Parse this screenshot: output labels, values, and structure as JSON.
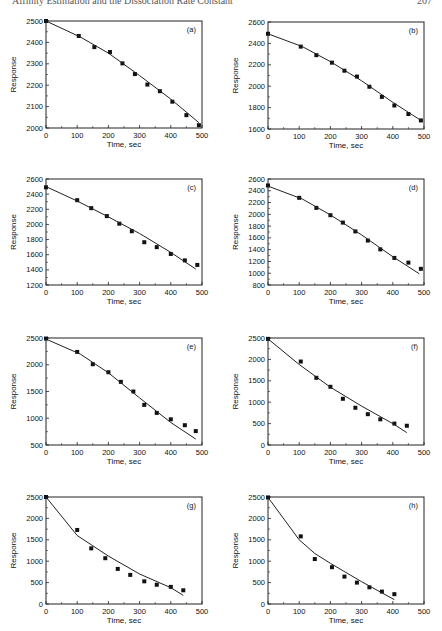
{
  "header": {
    "running_title": "Affinity Estimation and the Dissociation Rate Constant",
    "page_number": "207"
  },
  "chart_data": [
    {
      "id": "a",
      "type": "scatter",
      "panel_label": "(a)",
      "xlabel": "Time, sec",
      "ylabel": "Response",
      "xlim": [
        0,
        500
      ],
      "ylim": [
        2000,
        2500
      ],
      "xticks": [
        0,
        100,
        200,
        300,
        400,
        500
      ],
      "yticks": [
        2000,
        2100,
        2200,
        2300,
        2400,
        2500
      ],
      "series": [
        {
          "name": "data",
          "kind": "points",
          "x": [
            0,
            105,
            155,
            205,
            245,
            285,
            325,
            365,
            405,
            450,
            490
          ],
          "y": [
            2500,
            2430,
            2378,
            2355,
            2302,
            2252,
            2203,
            2172,
            2123,
            2060,
            2013
          ]
        },
        {
          "name": "fit",
          "kind": "line",
          "x": [
            0,
            110,
            200,
            300,
            400,
            490
          ],
          "y": [
            2500,
            2425,
            2350,
            2245,
            2135,
            2025
          ]
        }
      ]
    },
    {
      "id": "b",
      "type": "scatter",
      "panel_label": "(b)",
      "xlabel": "Time, sec",
      "ylabel": "Response",
      "xlim": [
        0,
        500
      ],
      "ylim": [
        1600,
        2600
      ],
      "xticks": [
        0,
        100,
        200,
        300,
        400,
        500
      ],
      "yticks": [
        1600,
        1800,
        2000,
        2200,
        2400,
        2600
      ],
      "series": [
        {
          "name": "data",
          "kind": "points",
          "x": [
            0,
            105,
            155,
            205,
            245,
            285,
            325,
            365,
            405,
            450,
            490
          ],
          "y": [
            2490,
            2370,
            2290,
            2220,
            2145,
            2090,
            1995,
            1900,
            1820,
            1740,
            1680
          ]
        },
        {
          "name": "fit",
          "kind": "line",
          "x": [
            0,
            110,
            200,
            300,
            400,
            490
          ],
          "y": [
            2490,
            2370,
            2230,
            2050,
            1850,
            1680
          ]
        }
      ]
    },
    {
      "id": "c",
      "type": "scatter",
      "panel_label": "(c)",
      "xlabel": "Time, sec",
      "ylabel": "Response",
      "xlim": [
        0,
        500
      ],
      "ylim": [
        1200,
        2600
      ],
      "xticks": [
        0,
        100,
        200,
        300,
        400,
        500
      ],
      "yticks": [
        1200,
        1400,
        1600,
        1800,
        2000,
        2200,
        2400,
        2600
      ],
      "series": [
        {
          "name": "data",
          "kind": "points",
          "x": [
            0,
            100,
            145,
            195,
            235,
            275,
            315,
            355,
            400,
            445,
            485
          ],
          "y": [
            2490,
            2320,
            2215,
            2110,
            2010,
            1910,
            1765,
            1700,
            1610,
            1525,
            1465
          ]
        },
        {
          "name": "fit",
          "kind": "line",
          "x": [
            0,
            100,
            200,
            300,
            400,
            480
          ],
          "y": [
            2500,
            2310,
            2100,
            1880,
            1630,
            1410
          ]
        }
      ]
    },
    {
      "id": "d",
      "type": "scatter",
      "panel_label": "(d)",
      "xlabel": "Time, sec",
      "ylabel": "Response",
      "xlim": [
        0,
        500
      ],
      "ylim": [
        800,
        2600
      ],
      "xticks": [
        0,
        100,
        200,
        300,
        400,
        500
      ],
      "yticks": [
        800,
        1000,
        1200,
        1400,
        1600,
        1800,
        2000,
        2200,
        2400,
        2600
      ],
      "series": [
        {
          "name": "data",
          "kind": "points",
          "x": [
            0,
            100,
            155,
            200,
            240,
            280,
            320,
            360,
            405,
            450,
            490
          ],
          "y": [
            2490,
            2280,
            2110,
            1985,
            1860,
            1710,
            1555,
            1405,
            1260,
            1180,
            1075
          ]
        },
        {
          "name": "fit",
          "kind": "line",
          "x": [
            0,
            110,
            200,
            300,
            400,
            485
          ],
          "y": [
            2480,
            2260,
            1990,
            1650,
            1280,
            990
          ]
        }
      ]
    },
    {
      "id": "e",
      "type": "scatter",
      "panel_label": "(e)",
      "xlabel": "Time, sec",
      "ylabel": "Response",
      "xlim": [
        0,
        500
      ],
      "ylim": [
        500,
        2500
      ],
      "xticks": [
        0,
        100,
        200,
        300,
        400,
        500
      ],
      "yticks": [
        500,
        1000,
        1500,
        2000,
        2500
      ],
      "series": [
        {
          "name": "data",
          "kind": "points",
          "x": [
            0,
            100,
            150,
            200,
            240,
            280,
            315,
            355,
            400,
            445,
            480
          ],
          "y": [
            2490,
            2240,
            2010,
            1860,
            1680,
            1500,
            1250,
            1100,
            980,
            870,
            760
          ]
        },
        {
          "name": "fit",
          "kind": "line",
          "x": [
            0,
            110,
            200,
            300,
            400,
            480
          ],
          "y": [
            2480,
            2200,
            1850,
            1380,
            920,
            610
          ]
        }
      ]
    },
    {
      "id": "f",
      "type": "scatter",
      "panel_label": "(f)",
      "xlabel": "Time, sec",
      "ylabel": "Response",
      "xlim": [
        0,
        500
      ],
      "ylim": [
        0,
        2500
      ],
      "xticks": [
        0,
        100,
        200,
        300,
        400,
        500
      ],
      "yticks": [
        0,
        500,
        1000,
        1500,
        2000,
        2500
      ],
      "series": [
        {
          "name": "data",
          "kind": "points",
          "x": [
            0,
            105,
            155,
            200,
            240,
            280,
            320,
            360,
            405,
            445
          ],
          "y": [
            2480,
            1950,
            1570,
            1360,
            1080,
            870,
            720,
            600,
            500,
            450
          ]
        },
        {
          "name": "fit",
          "kind": "line",
          "x": [
            0,
            100,
            200,
            300,
            400,
            445
          ],
          "y": [
            2480,
            1880,
            1350,
            910,
            500,
            290
          ]
        }
      ]
    },
    {
      "id": "g",
      "type": "scatter",
      "panel_label": "(g)",
      "xlabel": "Time, sec",
      "ylabel": "Response",
      "xlim": [
        0,
        500
      ],
      "ylim": [
        0,
        2500
      ],
      "xticks": [
        0,
        100,
        200,
        300,
        400,
        500
      ],
      "yticks": [
        0,
        500,
        1000,
        1500,
        2000,
        2500
      ],
      "series": [
        {
          "name": "data",
          "kind": "points",
          "x": [
            0,
            100,
            145,
            190,
            230,
            270,
            315,
            355,
            400,
            440
          ],
          "y": [
            2500,
            1730,
            1300,
            1070,
            820,
            680,
            530,
            450,
            400,
            320
          ]
        },
        {
          "name": "fit",
          "kind": "line",
          "x": [
            0,
            100,
            200,
            300,
            400,
            440
          ],
          "y": [
            2500,
            1600,
            1120,
            700,
            380,
            200
          ]
        }
      ]
    },
    {
      "id": "h",
      "type": "scatter",
      "panel_label": "(h)",
      "xlabel": "Time, sec",
      "ylabel": "Response",
      "xlim": [
        0,
        500
      ],
      "ylim": [
        0,
        2500
      ],
      "xticks": [
        0,
        100,
        200,
        300,
        400,
        500
      ],
      "yticks": [
        0,
        500,
        1000,
        1500,
        2000,
        2500
      ],
      "series": [
        {
          "name": "data",
          "kind": "points",
          "x": [
            0,
            105,
            150,
            205,
            245,
            285,
            325,
            365,
            405
          ],
          "y": [
            2490,
            1580,
            1050,
            860,
            640,
            500,
            390,
            290,
            230
          ]
        },
        {
          "name": "fit",
          "kind": "line",
          "x": [
            0,
            100,
            150,
            200,
            300,
            405
          ],
          "y": [
            2490,
            1500,
            1180,
            950,
            520,
            100
          ]
        }
      ]
    }
  ],
  "layout": {
    "panels": [
      {
        "id": "a",
        "plot": {
          "left": 46,
          "top": 21,
          "right": 202,
          "bottom": 128
        }
      },
      {
        "id": "b",
        "plot": {
          "left": 268,
          "top": 22,
          "right": 424,
          "bottom": 129
        }
      },
      {
        "id": "c",
        "plot": {
          "left": 46,
          "top": 179,
          "right": 202,
          "bottom": 285
        }
      },
      {
        "id": "d",
        "plot": {
          "left": 268,
          "top": 179,
          "right": 424,
          "bottom": 285
        }
      },
      {
        "id": "e",
        "plot": {
          "left": 46,
          "top": 338,
          "right": 202,
          "bottom": 445
        }
      },
      {
        "id": "f",
        "plot": {
          "left": 268,
          "top": 338,
          "right": 424,
          "bottom": 445
        }
      },
      {
        "id": "g",
        "plot": {
          "left": 46,
          "top": 497,
          "right": 202,
          "bottom": 604
        }
      },
      {
        "id": "h",
        "plot": {
          "left": 268,
          "top": 497,
          "right": 424,
          "bottom": 604
        }
      }
    ]
  }
}
